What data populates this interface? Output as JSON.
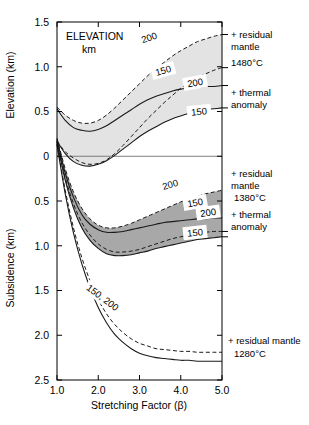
{
  "figure": {
    "title_upper": "ELEVATION",
    "title_upper_unit": "km",
    "x_axis_title": "Stretching Factor (β)",
    "y_axis_title_upper": "Elevation (km)",
    "y_axis_title_lower": "Subsidence (km)"
  },
  "axes": {
    "x": {
      "label": "Stretching Factor (β)",
      "min": 1.0,
      "max": 5.0,
      "ticks": [
        1.0,
        2.0,
        3.0,
        4.0,
        5.0
      ],
      "tick_labels": [
        "1.0",
        "2.0",
        "3.0",
        "4.0",
        "5.0"
      ]
    },
    "y": {
      "label_upper": "Elevation (km)",
      "label_lower": "Subsidence (km)",
      "min_plot_value": -2.5,
      "max_plot_value": 1.5,
      "ticks": [
        1.5,
        1.0,
        0.5,
        0.0,
        -0.5,
        -1.0,
        -1.5,
        -2.0,
        -2.5
      ],
      "tick_labels": [
        "1.5",
        "1.0",
        "0.5",
        "0",
        "0.5",
        "1.0",
        "1.5",
        "2.0",
        "2.5"
      ],
      "zero_line": 0.0
    },
    "grid": false,
    "box": "left-bottom-right-top"
  },
  "curve_labels": {
    "l1": "200",
    "l2": "150",
    "l3": "200",
    "l4": "150",
    "l5": "200",
    "l6": "150",
    "l7": "200",
    "l8": "150",
    "l9": "150, 200"
  },
  "annotations": {
    "a1_line1": "+ residual",
    "a1_line2": "mantle",
    "a1_line3": "1480°C",
    "a2_line1": "+ thermal",
    "a2_line2": "anomaly",
    "a3_line1": "+ residual",
    "a3_line2": "mantle",
    "a3_line3": "1380°C",
    "a4_line1": "+ thermal",
    "a4_line2": "anomaly",
    "a5_line1": "+ residual mantle",
    "a5_line2": "1280°C"
  },
  "colors": {
    "band_light": "#e3e3e3",
    "band_dark": "#a8a8a8",
    "curve": "#1a1a1a",
    "zero_line": "#6f6f6f",
    "background": "#ffffff"
  },
  "chart_data": {
    "type": "line",
    "xlabel": "Stretching Factor (β)",
    "ylabel": "Elevation (km) / Subsidence (km)",
    "xlim": [
      1.0,
      5.0
    ],
    "ylim": [
      -2.5,
      1.5
    ],
    "grid": false,
    "legend": "inline curve labels and right-side annotations",
    "note": "Positive values read on the upper 'Elevation (km)' scale; values below zero read on the lower 'Subsidence (km)' scale (increasing downward).",
    "x": [
      1.0,
      1.2,
      1.4,
      1.6,
      1.8,
      2.0,
      2.2,
      2.4,
      2.6,
      2.8,
      3.0,
      3.2,
      3.4,
      3.6,
      3.8,
      4.0,
      4.2,
      4.4,
      4.6,
      4.8,
      5.0
    ],
    "series": [
      {
        "name": "1480°C + residual mantle, 200 km",
        "group": "1480C residual mantle",
        "lithosphere_km": 200,
        "style": "dashed",
        "label": "200",
        "values": [
          0.55,
          0.46,
          0.4,
          0.37,
          0.37,
          0.4,
          0.46,
          0.54,
          0.63,
          0.72,
          0.81,
          0.9,
          0.98,
          1.05,
          1.12,
          1.18,
          1.23,
          1.28,
          1.31,
          1.34,
          1.36
        ]
      },
      {
        "name": "1480°C + residual mantle, 150 km",
        "group": "1480C residual mantle",
        "lithosphere_km": 150,
        "style": "dashed",
        "label": "150",
        "values": [
          0.17,
          0.05,
          -0.02,
          -0.07,
          -0.09,
          -0.08,
          -0.04,
          0.03,
          0.12,
          0.22,
          0.32,
          0.42,
          0.51,
          0.6,
          0.68,
          0.76,
          0.82,
          0.88,
          0.92,
          0.96,
          0.99
        ]
      },
      {
        "name": "1480°C + thermal anomaly, 200 km",
        "group": "1480C thermal anomaly",
        "lithosphere_km": 200,
        "style": "solid",
        "label": "200",
        "values": [
          0.53,
          0.4,
          0.32,
          0.29,
          0.28,
          0.3,
          0.34,
          0.4,
          0.46,
          0.52,
          0.58,
          0.63,
          0.67,
          0.7,
          0.73,
          0.75,
          0.76,
          0.77,
          0.78,
          0.78,
          0.79
        ]
      },
      {
        "name": "1480°C + thermal anomaly, 150 km",
        "group": "1480C thermal anomaly",
        "lithosphere_km": 150,
        "style": "solid",
        "label": "150",
        "values": [
          0.17,
          0.03,
          -0.06,
          -0.1,
          -0.11,
          -0.09,
          -0.05,
          0.01,
          0.08,
          0.15,
          0.22,
          0.28,
          0.33,
          0.38,
          0.42,
          0.45,
          0.48,
          0.5,
          0.52,
          0.53,
          0.54
        ]
      },
      {
        "name": "1380°C + residual mantle, 200 km",
        "group": "1380C residual mantle",
        "lithosphere_km": 200,
        "style": "dashed",
        "label": "200",
        "values": [
          0.2,
          -0.14,
          -0.4,
          -0.58,
          -0.7,
          -0.77,
          -0.8,
          -0.8,
          -0.78,
          -0.75,
          -0.71,
          -0.67,
          -0.63,
          -0.59,
          -0.55,
          -0.51,
          -0.48,
          -0.45,
          -0.42,
          -0.4,
          -0.38
        ]
      },
      {
        "name": "1380°C + residual mantle, 150 km",
        "group": "1380C residual mantle",
        "lithosphere_km": 150,
        "style": "dashed",
        "label": "150",
        "values": [
          0.17,
          -0.24,
          -0.53,
          -0.74,
          -0.88,
          -0.98,
          -1.04,
          -1.07,
          -1.07,
          -1.06,
          -1.04,
          -1.01,
          -0.98,
          -0.95,
          -0.92,
          -0.9,
          -0.88,
          -0.86,
          -0.85,
          -0.84,
          -0.84
        ]
      },
      {
        "name": "1380°C + thermal anomaly, 200 km",
        "group": "1380C thermal anomaly",
        "lithosphere_km": 200,
        "style": "solid",
        "label": "200",
        "values": [
          0.19,
          -0.19,
          -0.46,
          -0.65,
          -0.76,
          -0.82,
          -0.85,
          -0.85,
          -0.84,
          -0.82,
          -0.8,
          -0.78,
          -0.76,
          -0.74,
          -0.73,
          -0.72,
          -0.71,
          -0.7,
          -0.7,
          -0.69,
          -0.69
        ]
      },
      {
        "name": "1380°C + thermal anomaly, 150 km",
        "group": "1380C thermal anomaly",
        "lithosphere_km": 150,
        "style": "solid",
        "label": "150",
        "values": [
          0.16,
          -0.27,
          -0.58,
          -0.8,
          -0.94,
          -1.03,
          -1.09,
          -1.11,
          -1.11,
          -1.1,
          -1.08,
          -1.06,
          -1.03,
          -1.01,
          -0.99,
          -0.97,
          -0.95,
          -0.93,
          -0.92,
          -0.91,
          -0.9
        ]
      },
      {
        "name": "1280°C + residual mantle, 200 km",
        "group": "1280C residual mantle",
        "lithosphere_km": 200,
        "style": "dashed",
        "label": "200",
        "values": [
          0.14,
          -0.38,
          -0.8,
          -1.13,
          -1.39,
          -1.6,
          -1.76,
          -1.88,
          -1.97,
          -2.04,
          -2.09,
          -2.12,
          -2.15,
          -2.16,
          -2.17,
          -2.18,
          -2.18,
          -2.19,
          -2.19,
          -2.19,
          -2.19
        ]
      },
      {
        "name": "1280°C + residual mantle, 150 km",
        "group": "1280C residual mantle",
        "lithosphere_km": 150,
        "style": "solid",
        "label": "150",
        "values": [
          0.13,
          -0.42,
          -0.86,
          -1.2,
          -1.47,
          -1.69,
          -1.86,
          -1.99,
          -2.08,
          -2.15,
          -2.2,
          -2.23,
          -2.25,
          -2.26,
          -2.27,
          -2.28,
          -2.28,
          -2.29,
          -2.29,
          -2.29,
          -2.29
        ]
      }
    ],
    "shaded_bands": [
      {
        "name": "1480C band",
        "color": "#e3e3e3",
        "between": [
          "1480°C + residual mantle, 200 km",
          "1480°C + thermal anomaly, 150 km"
        ]
      },
      {
        "name": "1380C band",
        "color": "#a8a8a8",
        "between": [
          "1380°C + residual mantle, 200 km",
          "1380°C + thermal anomaly, 150 km"
        ]
      }
    ]
  }
}
